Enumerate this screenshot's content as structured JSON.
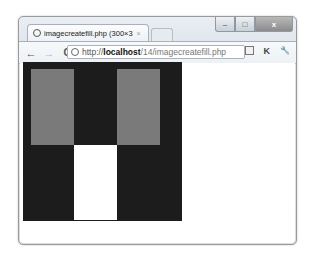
{
  "window": {
    "controls": {
      "minimize": "–",
      "maximize": "□",
      "close": "x"
    }
  },
  "tab": {
    "title": "imagecreatefill.php (300×3",
    "close_glyph": "×",
    "favicon": "globe-icon"
  },
  "toolbar": {
    "back_glyph": "←",
    "forward_glyph": "→",
    "reload_glyph": "C",
    "url": {
      "scheme": "http://",
      "host": "localhost",
      "path": "/14/imagecreatefill.php"
    },
    "icons": [
      "page-icon",
      "k-extension-icon",
      "wrench-icon"
    ],
    "k_glyph": "K",
    "wrench_glyph": "🔧"
  },
  "image": {
    "background": "#1c1c1c",
    "rects": [
      {
        "name": "left-gray-rect",
        "color": "#7a7a7a"
      },
      {
        "name": "right-gray-rect",
        "color": "#7a7a7a"
      },
      {
        "name": "white-rect",
        "color": "#ffffff"
      }
    ]
  }
}
